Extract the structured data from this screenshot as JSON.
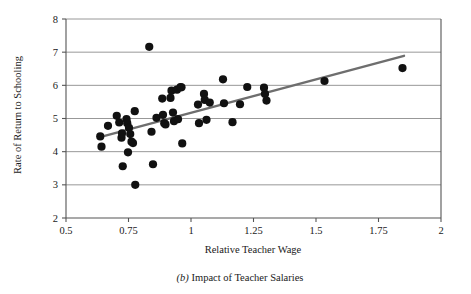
{
  "figure": {
    "caption_prefix": "(b)",
    "caption_text": " Impact of Teacher Salaries"
  },
  "chart_data": {
    "type": "scatter",
    "title": "",
    "subtitle": "",
    "xlabel": "Relative Teacher Wage",
    "ylabel": "Rate of Return to Schooling",
    "xlim": [
      0.5,
      2.0
    ],
    "ylim": [
      2,
      8
    ],
    "xticks": [
      0.5,
      0.75,
      1,
      1.25,
      1.5,
      1.75,
      2
    ],
    "xtick_labels": [
      "0.5",
      "0.75",
      "1",
      "1.25",
      "1.5",
      "1.75",
      "2"
    ],
    "yticks": [
      2,
      3,
      4,
      5,
      6,
      7,
      8
    ],
    "ytick_labels": [
      "2",
      "3",
      "4",
      "5",
      "6",
      "7",
      "8"
    ],
    "grid": "horizontal",
    "grid_color": "#8c8c8c",
    "axis_color": "#555555",
    "marker_color": "#111111",
    "marker_size": 4.1,
    "legend": null,
    "points": [
      {
        "x": 0.637,
        "y": 4.46
      },
      {
        "x": 0.642,
        "y": 4.15
      },
      {
        "x": 0.668,
        "y": 4.78
      },
      {
        "x": 0.703,
        "y": 5.08
      },
      {
        "x": 0.713,
        "y": 4.88
      },
      {
        "x": 0.722,
        "y": 4.42
      },
      {
        "x": 0.724,
        "y": 4.55
      },
      {
        "x": 0.727,
        "y": 3.56
      },
      {
        "x": 0.742,
        "y": 4.98
      },
      {
        "x": 0.745,
        "y": 4.86
      },
      {
        "x": 0.748,
        "y": 3.98
      },
      {
        "x": 0.752,
        "y": 4.72
      },
      {
        "x": 0.757,
        "y": 4.53
      },
      {
        "x": 0.762,
        "y": 4.3
      },
      {
        "x": 0.768,
        "y": 4.26
      },
      {
        "x": 0.775,
        "y": 5.22
      },
      {
        "x": 0.777,
        "y": 3.0
      },
      {
        "x": 0.833,
        "y": 7.16
      },
      {
        "x": 0.842,
        "y": 4.6
      },
      {
        "x": 0.848,
        "y": 3.62
      },
      {
        "x": 0.862,
        "y": 5.02
      },
      {
        "x": 0.885,
        "y": 5.6
      },
      {
        "x": 0.888,
        "y": 5.11
      },
      {
        "x": 0.893,
        "y": 4.86
      },
      {
        "x": 0.898,
        "y": 4.82
      },
      {
        "x": 0.918,
        "y": 5.62
      },
      {
        "x": 0.922,
        "y": 5.84
      },
      {
        "x": 0.928,
        "y": 5.18
      },
      {
        "x": 0.932,
        "y": 4.92
      },
      {
        "x": 0.944,
        "y": 5.87
      },
      {
        "x": 0.948,
        "y": 4.98
      },
      {
        "x": 0.958,
        "y": 5.95
      },
      {
        "x": 0.962,
        "y": 5.94
      },
      {
        "x": 0.965,
        "y": 4.25
      },
      {
        "x": 1.028,
        "y": 5.42
      },
      {
        "x": 1.032,
        "y": 4.86
      },
      {
        "x": 1.052,
        "y": 5.74
      },
      {
        "x": 1.055,
        "y": 5.56
      },
      {
        "x": 1.062,
        "y": 4.96
      },
      {
        "x": 1.075,
        "y": 5.48
      },
      {
        "x": 1.128,
        "y": 6.18
      },
      {
        "x": 1.132,
        "y": 5.46
      },
      {
        "x": 1.166,
        "y": 4.89
      },
      {
        "x": 1.196,
        "y": 5.43
      },
      {
        "x": 1.225,
        "y": 5.95
      },
      {
        "x": 1.292,
        "y": 5.93
      },
      {
        "x": 1.296,
        "y": 5.74
      },
      {
        "x": 1.302,
        "y": 5.54
      },
      {
        "x": 1.534,
        "y": 6.13
      },
      {
        "x": 1.846,
        "y": 6.52
      }
    ],
    "trendline": {
      "type": "linear-fit",
      "color": "#6e6e6e",
      "width": 2.4,
      "x_start": 0.632,
      "y_start": 4.43,
      "x_end": 1.852,
      "y_end": 6.89
    }
  }
}
